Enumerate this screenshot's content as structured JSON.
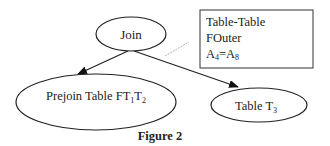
{
  "figure": {
    "caption": "Figure 2",
    "nodes": {
      "join": {
        "label": "Join"
      },
      "prejoin": {
        "label": "Prejoin Table FT",
        "sub1": "1",
        "mid": "T",
        "sub2": "2"
      },
      "table3": {
        "label": "Table T",
        "sub": "3"
      }
    },
    "annotation": {
      "line1": "Table-Table",
      "line2": "FOuter",
      "line3_a": "A",
      "line3_a_sub": "4",
      "line3_eq": "=A",
      "line3_b_sub": "8"
    },
    "edges": [
      {
        "from": "join",
        "to": "prejoin"
      },
      {
        "from": "join",
        "to": "table3"
      }
    ],
    "colors": {
      "stroke": "#222222",
      "annotation_link": "#9a9a9a"
    }
  }
}
